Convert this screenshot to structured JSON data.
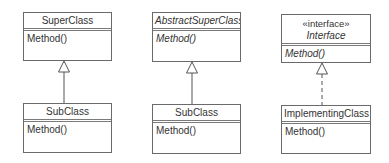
{
  "diagram": {
    "type": "UML class diagram",
    "line_color": "#6a6a6a",
    "text_color": "#333333",
    "background": "#ffffff",
    "columns": [
      {
        "relationship": "generalization",
        "line_style": "solid",
        "parent": {
          "name": "SuperClass",
          "abstract": false,
          "stereotype": null,
          "methods": [
            "Method()"
          ]
        },
        "child": {
          "name": "SubClass",
          "methods": [
            "Method()"
          ]
        }
      },
      {
        "relationship": "generalization",
        "line_style": "solid",
        "parent": {
          "name": "AbstractSuperClass",
          "abstract": true,
          "stereotype": null,
          "methods": [
            "Method()"
          ]
        },
        "child": {
          "name": "SubClass",
          "methods": [
            "Method()"
          ]
        }
      },
      {
        "relationship": "realization",
        "line_style": "dashed",
        "parent": {
          "name": "Interface",
          "abstract": true,
          "stereotype": "«interface»",
          "methods": [
            "Method()"
          ]
        },
        "child": {
          "name": "ImplementingClass",
          "methods": [
            "Method()"
          ]
        }
      }
    ]
  }
}
